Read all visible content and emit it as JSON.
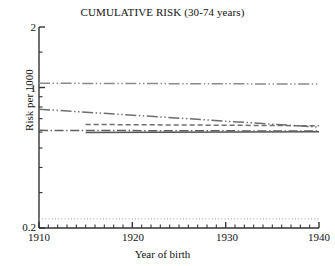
{
  "chart_data": {
    "type": "line",
    "title": "CUMULATIVE RISK (30-74 years)",
    "xlabel": "Year of birth",
    "ylabel": "Risk per 1000",
    "xlim": [
      1910,
      1940
    ],
    "ylim": [
      0.2,
      2
    ],
    "yscale": "log",
    "grid": false,
    "legend": "none",
    "xticks": [
      1910,
      1920,
      1930,
      1940
    ],
    "xtick_labels": [
      "1910",
      "1920",
      "1930",
      "1940"
    ],
    "yticks": [
      0.2,
      1,
      2
    ],
    "ytick_labels": [
      "0.2",
      "1",
      "2"
    ],
    "yminor_ticks": [
      0.3,
      0.4,
      0.5,
      0.6,
      0.7,
      0.8,
      0.9,
      1.5
    ],
    "series": [
      {
        "name": "upper-flat-line",
        "style": "dash-dot-dot",
        "color": "#8a8a8a",
        "x": [
          1910,
          1940
        ],
        "values": [
          1.05,
          1.04
        ]
      },
      {
        "name": "declining-line",
        "style": "dash-dot-dot",
        "color": "#6e6e6e",
        "x": [
          1910,
          1940
        ],
        "values": [
          0.78,
          0.635
        ]
      },
      {
        "name": "dashed-flat-line",
        "style": "dashed",
        "color": "#707070",
        "x": [
          1915,
          1940
        ],
        "values": [
          0.655,
          0.645
        ]
      },
      {
        "name": "solid-flat-line",
        "style": "solid",
        "color": "#555555",
        "x": [
          1915,
          1940
        ],
        "values": [
          0.598,
          0.602
        ]
      },
      {
        "name": "dash-dot-flat-line",
        "style": "dash-dot",
        "color": "#5f5f5f",
        "x": [
          1910,
          1940
        ],
        "values": [
          0.612,
          0.607
        ]
      },
      {
        "name": "lower-dotted-line",
        "style": "dotted",
        "color": "#9a9a9a",
        "x": [
          1910,
          1940
        ],
        "values": [
          0.222,
          0.222
        ]
      }
    ]
  },
  "axes": {
    "ytick_0": "2",
    "ytick_1": "1",
    "ytick_2": "0.2",
    "xtick_0": "1910",
    "xtick_1": "1920",
    "xtick_2": "1930",
    "xtick_3": "1940"
  }
}
